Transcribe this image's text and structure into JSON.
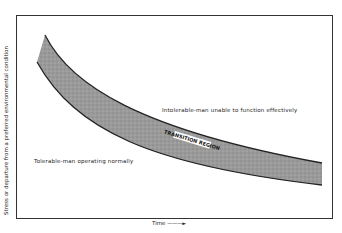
{
  "diagram": {
    "y_axis_label": "Stress or departure from a preferred environmental condition",
    "x_axis_label": "Time",
    "x_axis_arrow": "———►",
    "regions": {
      "upper": "Intolerable-man unable to function effectively",
      "band": "TRANSITION REGION",
      "lower": "Tolerable-man operating normally"
    },
    "colors": {
      "band_fill": "#9a9a9a",
      "band_edge": "#222222",
      "frame": "#333333"
    }
  }
}
